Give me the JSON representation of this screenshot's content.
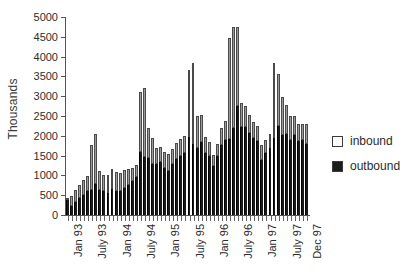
{
  "chart_data": {
    "type": "bar",
    "stacked": true,
    "title": "",
    "xlabel": "",
    "ylabel": "Thousands",
    "ylim": [
      0,
      5000
    ],
    "ytick_step": 500,
    "yticks": [
      0,
      500,
      1000,
      1500,
      2000,
      2500,
      3000,
      3500,
      4000,
      4500,
      5000
    ],
    "grid": false,
    "legend_position": "right",
    "legend": [
      "inbound",
      "outbound"
    ],
    "colors": {
      "inbound": "#9a9a9a",
      "outbound": "#191919"
    },
    "categories": [
      "Jan 93",
      "Feb 93",
      "Mar 93",
      "Apr 93",
      "May 93",
      "Jun 93",
      "July 93",
      "Aug 93",
      "Sep 93",
      "Oct 93",
      "Nov 93",
      "Dec 93",
      "Jan 94",
      "Feb 94",
      "Mar 94",
      "Apr 94",
      "May 94",
      "Jun 94",
      "July 94",
      "Aug 94",
      "Sep 94",
      "Oct 94",
      "Nov 94",
      "Dec 94",
      "Jan 95",
      "Feb 95",
      "Mar 95",
      "Apr 95",
      "May 95",
      "Jun 95",
      "July 95",
      "Aug 95",
      "Sep 95",
      "Oct 95",
      "Nov 95",
      "Dec 95",
      "Jan 96",
      "Feb 96",
      "Mar 96",
      "Apr 96",
      "May 96",
      "Jun 96",
      "July 96",
      "Aug 96",
      "Sep 96",
      "Oct 96",
      "Nov 96",
      "Dec 96",
      "Jan 97",
      "Feb 97",
      "Mar 97",
      "Apr 97",
      "May 97",
      "Jun 97",
      "July 97",
      "Aug 97",
      "Sep 97",
      "Oct 97",
      "Nov 97",
      "Dec 97"
    ],
    "xtick_labels": [
      "Jan 93",
      "July 93",
      "Jan 94",
      "July 94",
      "Jan 95",
      "July 95",
      "Jan 96",
      "July 96",
      "Jan 97",
      "July 97",
      "Dec 97"
    ],
    "xtick_indices": [
      0,
      6,
      12,
      18,
      24,
      30,
      36,
      42,
      48,
      54,
      59
    ],
    "series": [
      {
        "name": "outbound",
        "values": [
          390,
          230,
          330,
          430,
          500,
          600,
          640,
          790,
          620,
          600,
          560,
          660,
          610,
          600,
          680,
          760,
          860,
          960,
          1590,
          1460,
          1440,
          1300,
          1280,
          1340,
          1180,
          1120,
          1280,
          1410,
          1490,
          1560,
          1960,
          1800,
          1690,
          1840,
          1560,
          1480,
          1230,
          1480,
          1780,
          1900,
          1920,
          2190,
          2760,
          2230,
          2210,
          2080,
          1940,
          1880,
          1400,
          1560,
          1690,
          1950,
          2240,
          2030,
          2050,
          1900,
          2030,
          1880,
          1900,
          1790
        ]
      },
      {
        "name": "inbound",
        "values": [
          25,
          250,
          290,
          340,
          390,
          390,
          1130,
          1250,
          490,
          420,
          440,
          500,
          480,
          450,
          460,
          410,
          320,
          300,
          1510,
          1740,
          760,
          640,
          420,
          380,
          400,
          410,
          390,
          400,
          420,
          430,
          1700,
          2040,
          820,
          690,
          410,
          370,
          290,
          310,
          430,
          480,
          2560,
          2550,
          1990,
          590,
          540,
          440,
          420,
          380,
          360,
          340,
          360,
          1900,
          1310,
          940,
          720,
          610,
          460,
          430,
          390,
          500
        ]
      }
    ],
    "totals": [
      415,
      480,
      620,
      770,
      890,
      990,
      1770,
      2040,
      1110,
      1020,
      1000,
      1160,
      1090,
      1050,
      1140,
      1170,
      1180,
      1260,
      3100,
      3200,
      2200,
      1940,
      1700,
      1720,
      1580,
      1530,
      1670,
      1810,
      1910,
      1990,
      3660,
      3840,
      2510,
      2530,
      1970,
      1850,
      1520,
      1790,
      2210,
      2380,
      4480,
      4740,
      4750,
      2820,
      2750,
      2520,
      2360,
      2260,
      1760,
      1900,
      2050,
      3850,
      3550,
      2970,
      2770,
      2510,
      2490,
      2310,
      2290,
      2290
    ]
  }
}
